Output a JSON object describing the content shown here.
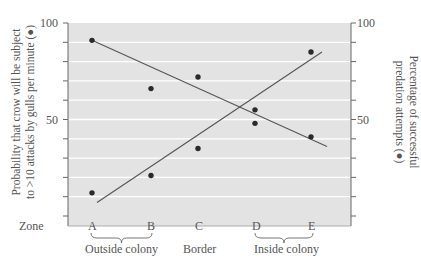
{
  "chart_data": {
    "type": "scatter",
    "title": "",
    "xlabel": "Zone",
    "ylabel_left": [
      "Probability that crow will be subject",
      "to >10 attacks by gulls per minute (●)"
    ],
    "ylabel_right": [
      "Percentage of successful",
      "predation attempts (●)"
    ],
    "categories": [
      "A",
      "B",
      "C",
      "D",
      "E"
    ],
    "category_groups": [
      {
        "label": "Outside colony",
        "span": [
          "A",
          "B"
        ]
      },
      {
        "label": "Border",
        "span": [
          "C"
        ]
      },
      {
        "label": "Inside colony",
        "span": [
          "D",
          "E"
        ]
      }
    ],
    "series": [
      {
        "name": "Probability that crow will be subject to >10 attacks by gulls per minute",
        "axis": "left",
        "values": [
          12,
          21,
          35,
          48,
          85
        ],
        "trend": "increasing",
        "trendline": {
          "x_start": "A",
          "y_start": 7,
          "x_end": "E",
          "y_end": 85
        }
      },
      {
        "name": "Percentage of successful predation attempts",
        "axis": "right",
        "values": [
          91,
          66,
          72,
          55,
          41
        ],
        "trend": "decreasing",
        "trendline": {
          "x_start": "A",
          "y_start": 91,
          "x_end": "E",
          "y_end": 36
        }
      }
    ],
    "ylim_left": [
      0,
      100
    ],
    "ylim_right": [
      0,
      100
    ],
    "yticks_left": [
      50,
      100
    ],
    "yticks_right": [
      50,
      100
    ],
    "grid": true,
    "grid_interval": 10
  },
  "axes": {
    "left_ticks": [
      "100",
      "50"
    ],
    "right_ticks": [
      "100",
      "50"
    ],
    "zone_label": "Zone",
    "zones": [
      "A",
      "B",
      "C",
      "D",
      "E"
    ],
    "groups": [
      "Outside colony",
      "Border",
      "Inside colony"
    ],
    "left_label_line1": "Probability that crow will be subject",
    "left_label_line2": "to >10 attacks by gulls per minute (●)",
    "right_label_line1": "Percentage of successful",
    "right_label_line2": "predation attempts (●)"
  },
  "colors": {
    "plot_bg": "#e3e3e3",
    "grid": "#ffffff",
    "ink": "#444444",
    "dot": "#2a2a2a"
  }
}
